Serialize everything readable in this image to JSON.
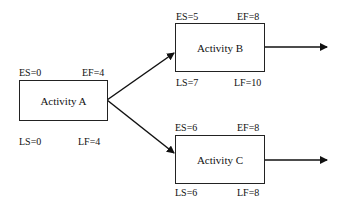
{
  "diagram": {
    "type": "activity-on-node network",
    "nodes": [
      {
        "id": "A",
        "label": "Activity A",
        "ES": "ES=0",
        "EF": "EF=4",
        "LS": "LS=0",
        "LF": "LF=4"
      },
      {
        "id": "B",
        "label": "Activity B",
        "ES": "ES=5",
        "EF": "EF=8",
        "LS": "LS=7",
        "LF": "LF=10"
      },
      {
        "id": "C",
        "label": "Activity C",
        "ES": "ES=6",
        "EF": "EF=8",
        "LS": "LS=6",
        "LF": "LF=8"
      }
    ],
    "edges": [
      {
        "from": "A",
        "to": "B"
      },
      {
        "from": "A",
        "to": "C"
      },
      {
        "from": "B",
        "to": "out"
      },
      {
        "from": "C",
        "to": "out"
      }
    ]
  }
}
